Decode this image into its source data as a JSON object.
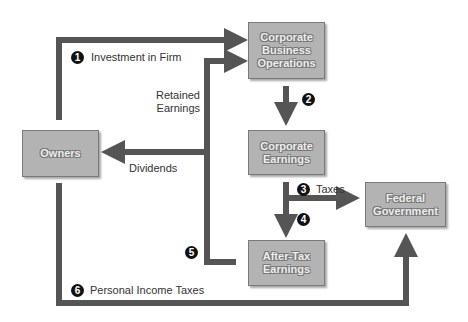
{
  "diagram": {
    "nodes": {
      "owners": "Owners",
      "corporate_business_operations": "Corporate Business Operations",
      "corporate_earnings": "Corporate Earnings",
      "federal_government": "Federal Government",
      "after_tax_earnings": "After-Tax Earnings"
    },
    "flows": [
      {
        "step": "1",
        "label": "Investment in Firm",
        "from": "Owners",
        "to": "Corporate Business Operations"
      },
      {
        "step": "2",
        "label": "",
        "from": "Corporate Business Operations",
        "to": "Corporate Earnings"
      },
      {
        "step": "3",
        "label": "Taxes",
        "from": "Corporate Earnings",
        "to": "Federal Government"
      },
      {
        "step": "4",
        "label": "",
        "from": "Corporate Earnings",
        "to": "After-Tax Earnings"
      },
      {
        "step": "5",
        "label": "",
        "from": "After-Tax Earnings",
        "to": "Retained Earnings / Dividends"
      },
      {
        "step": "6",
        "label": "Personal Income Taxes",
        "from": "Owners",
        "to": "Federal Government"
      }
    ],
    "labels": {
      "retained_earnings": "Retained Earnings",
      "dividends": "Dividends"
    },
    "colors": {
      "arrow": "#555555",
      "box_fill": "#b3b3b3",
      "box_text": "#eeeeee",
      "badge": "#111111"
    }
  }
}
